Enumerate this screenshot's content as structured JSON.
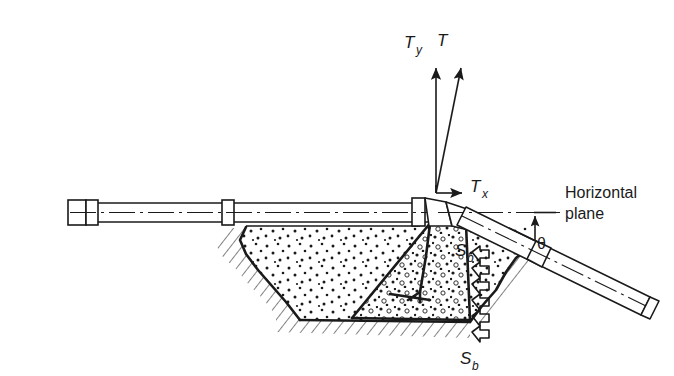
{
  "figure": {
    "background_color": "#ffffff",
    "ink_color": "#1a1a1a"
  },
  "labels": {
    "thrust_vertical": "T",
    "thrust_vertical_sub": "y",
    "thrust_resultant": "T",
    "thrust_horizontal": "T",
    "thrust_horizontal_sub": "x",
    "horizontal_plane_line1": "Horizontal",
    "horizontal_plane_line2": "plane",
    "angle": "θ",
    "bearing_upper": "S",
    "bearing_upper_sub": "b",
    "bearing_lower": "S",
    "bearing_lower_sub": "b"
  },
  "vectors": [
    {
      "name": "T_y",
      "origin": [
        436,
        193
      ],
      "tip": [
        436,
        62
      ],
      "direction": "vertical-up",
      "label": "Ty"
    },
    {
      "name": "T",
      "origin": [
        436,
        193
      ],
      "tip": [
        462,
        62
      ],
      "direction": "up-right-steep",
      "label": "T"
    },
    {
      "name": "T_x",
      "origin": [
        436,
        193
      ],
      "tip": [
        466,
        193
      ],
      "direction": "horizontal-right",
      "label": "Tx"
    }
  ],
  "geometry": {
    "horizontal_pipe_axis_y": 212,
    "bend_point": [
      436,
      212
    ],
    "inclined_pipe_angle_deg": 26,
    "trench_bottom_y": 318,
    "ground_line_y": 224
  },
  "annotations": {
    "angle_marker": "angle theta measured between horizontal plane and inclined pipe axis",
    "bearing_arrows_count": 6
  }
}
